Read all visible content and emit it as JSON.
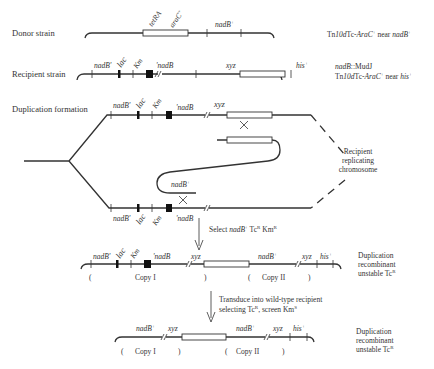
{
  "rows": {
    "donor": {
      "label": "Donor strain",
      "genes": {
        "tetRA": "tetRA",
        "araC": "araC",
        "araC_sup": "+",
        "nadB": "nadB",
        "nadB_sup": "+"
      },
      "note": {
        "p1": "Tn",
        "p2": "10d",
        "p3": "Tc-",
        "p4": "AraC",
        "p5": "+",
        "p6": " near ",
        "p7": "nadB",
        "p8": "+"
      }
    },
    "recipient": {
      "label": "Recipient strain",
      "genes": {
        "nadBp": "nadB'",
        "lac": "lac",
        "km": "Km",
        "pnadB": "'nadB",
        "xyz": "xyz",
        "his": "his",
        "his_sup": "+"
      },
      "note1": {
        "p1": "nadB",
        "p2": "::MudJ"
      },
      "note2": {
        "p1": "Tn",
        "p2": "10d",
        "p3": "Tc-",
        "p4": "AraC",
        "p5": "+",
        "p6": " near ",
        "p7": "his",
        "p8": "+"
      }
    },
    "duplication": {
      "label": "Duplication formation",
      "genes": {
        "nadBp": "nadB'",
        "lac": "lac",
        "km": "Km",
        "pnadB": "'nadB",
        "xyz": "xyz",
        "nadB": "nadB",
        "nadB_sup": "+"
      },
      "chromosome": [
        "Recipient",
        "replicating",
        "chromosome"
      ]
    },
    "step1": {
      "p1": "Select ",
      "p2": "nadB",
      "p3": "+",
      "p4": " Tc",
      "p5": "R",
      "p6": " Km",
      "p7": "R"
    },
    "recombinant1": {
      "genes": {
        "nadBp": "nadB'",
        "lac": "lac",
        "km": "Km",
        "pnadB": "'nadB",
        "xyz1": "xyz",
        "nadB": "nadB",
        "nadB_sup": "+",
        "xyz2": "xyz",
        "his": "his",
        "his_sup": "+"
      },
      "copies": {
        "open1": "(",
        "copy1": "Copy I",
        "close1": ")",
        "open2": "(",
        "copy2": "Copy II",
        "close2": ")"
      },
      "note": [
        "Duplication",
        "recombinant"
      ],
      "note3": {
        "p1": "unstable Tc",
        "p2": "R"
      }
    },
    "step2": {
      "line1": "Transduce into wild-type recipient",
      "line2": {
        "p1": "selecting Tc",
        "p2": "R",
        "p3": ", screen Km",
        "p4": "S"
      }
    },
    "recombinant2": {
      "genes": {
        "nadB1": "nadB",
        "nadB1_sup": "+",
        "xyz1": "xyz",
        "nadB2": "nadB",
        "nadB2_sup": "+",
        "xyz2": "xyz",
        "his": "his",
        "his_sup": "+"
      },
      "copies": {
        "open1": "(",
        "copy1": "Copy I",
        "close1": ")",
        "open2": "(",
        "copy2": "Copy II",
        "close2": ")"
      },
      "note": [
        "Duplication",
        "recombinant"
      ],
      "note3": {
        "p1": "unstable Tc",
        "p2": "R"
      }
    }
  }
}
